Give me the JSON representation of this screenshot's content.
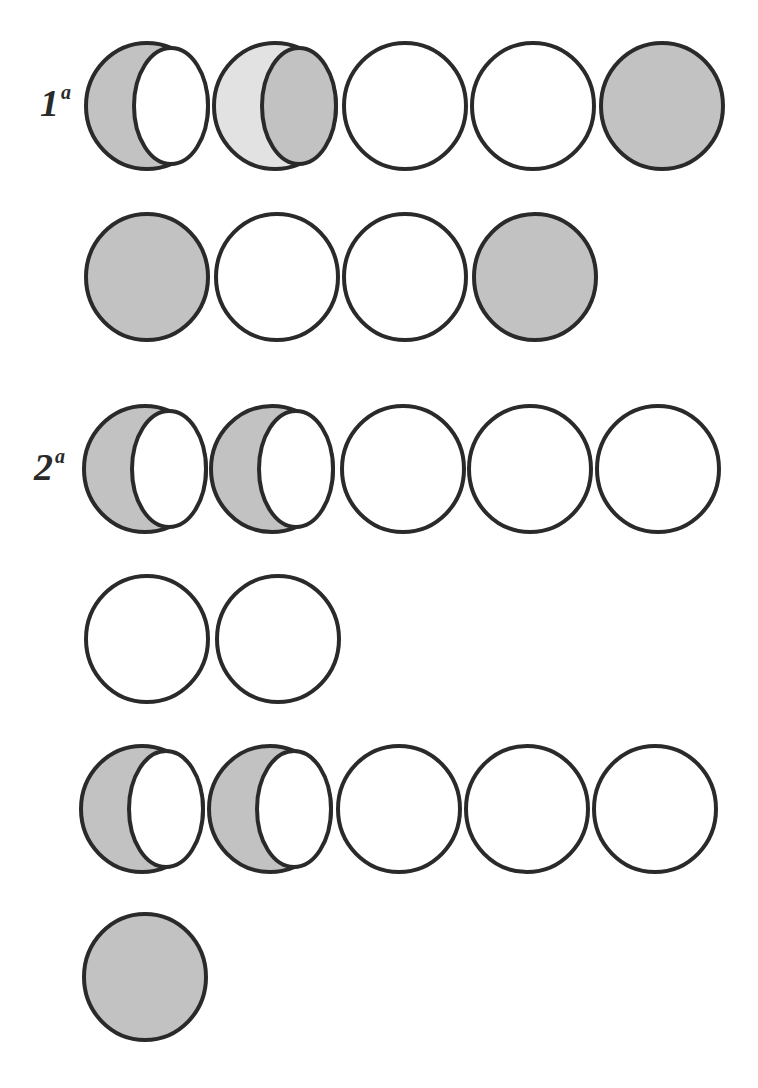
{
  "figure": {
    "colors": {
      "stroke": "#2a2a2a",
      "fill_dark": "#c2c2c2",
      "fill_light": "#e2e2e2",
      "empty": "#ffffff"
    },
    "labels": [
      {
        "id": "row1",
        "number": "1",
        "suffix": "a",
        "x": 40,
        "y": 84
      },
      {
        "id": "row3",
        "number": "2",
        "suffix": "a",
        "x": 34,
        "y": 448
      }
    ],
    "rows": [
      {
        "row": 1,
        "cy": 106,
        "shapes": [
          {
            "cx": 147,
            "type": "crescent",
            "outer_fill": "fill_dark",
            "inner_fill": "empty"
          },
          {
            "cx": 275,
            "type": "crescent",
            "outer_fill": "fill_light",
            "inner_fill": "fill_dark"
          },
          {
            "cx": 405,
            "type": "empty"
          },
          {
            "cx": 533,
            "type": "empty"
          },
          {
            "cx": 662,
            "type": "filled"
          }
        ]
      },
      {
        "row": 2,
        "cy": 277,
        "shapes": [
          {
            "cx": 147,
            "type": "filled"
          },
          {
            "cx": 277,
            "type": "empty"
          },
          {
            "cx": 405,
            "type": "empty"
          },
          {
            "cx": 535,
            "type": "filled"
          }
        ]
      },
      {
        "row": 3,
        "cy": 469,
        "shapes": [
          {
            "cx": 145,
            "type": "crescent",
            "outer_fill": "fill_dark",
            "inner_fill": "empty"
          },
          {
            "cx": 272,
            "type": "crescent",
            "outer_fill": "fill_dark",
            "inner_fill": "empty"
          },
          {
            "cx": 403,
            "type": "empty"
          },
          {
            "cx": 530,
            "type": "empty"
          },
          {
            "cx": 658,
            "type": "empty"
          }
        ]
      },
      {
        "row": 4,
        "cy": 639,
        "shapes": [
          {
            "cx": 147,
            "type": "empty"
          },
          {
            "cx": 278,
            "type": "empty"
          }
        ]
      },
      {
        "row": 5,
        "cy": 809,
        "shapes": [
          {
            "cx": 142,
            "type": "crescent",
            "outer_fill": "fill_dark",
            "inner_fill": "empty"
          },
          {
            "cx": 270,
            "type": "crescent",
            "outer_fill": "fill_dark",
            "inner_fill": "empty"
          },
          {
            "cx": 399,
            "type": "empty"
          },
          {
            "cx": 527,
            "type": "empty"
          },
          {
            "cx": 655,
            "type": "empty"
          }
        ]
      },
      {
        "row": 6,
        "cy": 977,
        "shapes": [
          {
            "cx": 145,
            "type": "filled"
          }
        ]
      }
    ],
    "geometry": {
      "rx": 61,
      "ry": 63,
      "stroke_width": 4,
      "inner_dx": 24,
      "inner_rx": 37,
      "inner_ry": 58
    }
  }
}
